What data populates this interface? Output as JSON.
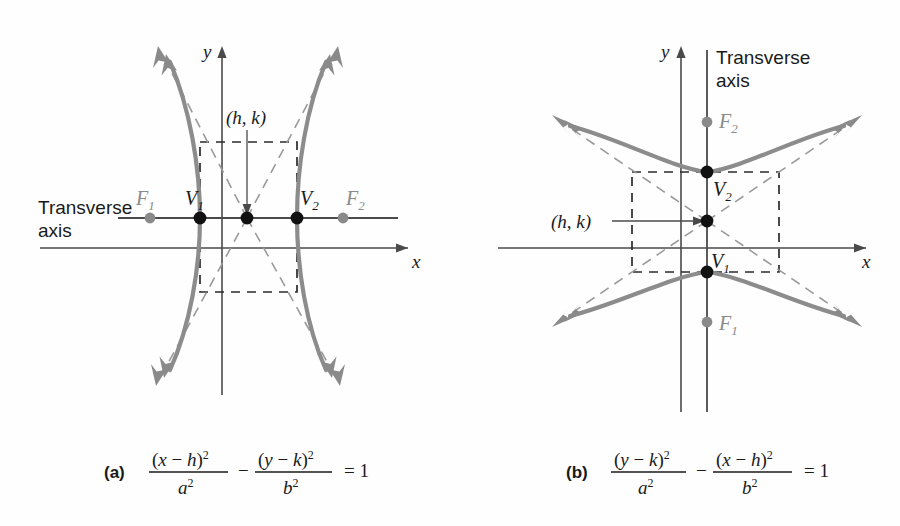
{
  "figure": {
    "title_alt": "Hyperbolas with center at (h, k)",
    "colors": {
      "curve": "#8c8c8c",
      "asymptote": "#9a9a9a",
      "axis": "#4a4a4a",
      "vertex_dot": "#111111",
      "focus_dot": "#8a8a8a",
      "box_dash": "#2b2b2b",
      "text": "#1a1a1a"
    }
  },
  "panel_a": {
    "letter": "(a)",
    "transverse_label_line1": "Transverse",
    "transverse_label_line2": "axis",
    "center_label": "(h, k)",
    "x_axis_label": "x",
    "y_axis_label": "y",
    "points": [
      {
        "name": "F1",
        "base": "F",
        "sub": "1",
        "kind": "focus"
      },
      {
        "name": "V1",
        "base": "V",
        "sub": "1",
        "kind": "vertex"
      },
      {
        "name": "center",
        "base": "",
        "sub": "",
        "kind": "center"
      },
      {
        "name": "V2",
        "base": "V",
        "sub": "2",
        "kind": "vertex"
      },
      {
        "name": "F2",
        "base": "F",
        "sub": "2",
        "kind": "focus"
      }
    ],
    "equation": {
      "num1_open": "(",
      "num1_var": "x",
      "num1_minus": " − ",
      "num1_shift": "h",
      "num1_close": ")",
      "num1_exp": "2",
      "den1_var": "a",
      "den1_exp": "2",
      "operator": "−",
      "num2_open": "(",
      "num2_var": "y",
      "num2_minus": " − ",
      "num2_shift": "k",
      "num2_close": ")",
      "num2_exp": "2",
      "den2_var": "b",
      "den2_exp": "2",
      "equals": "= 1"
    },
    "equation_plain": "(x − h)^2 / a^2 − (y − k)^2 / b^2 = 1"
  },
  "panel_b": {
    "letter": "(b)",
    "transverse_label_line1": "Transverse",
    "transverse_label_line2": "axis",
    "center_label": "(h, k)",
    "x_axis_label": "x",
    "y_axis_label": "y",
    "points": [
      {
        "name": "F2",
        "base": "F",
        "sub": "2",
        "kind": "focus"
      },
      {
        "name": "V2",
        "base": "V",
        "sub": "2",
        "kind": "vertex"
      },
      {
        "name": "center",
        "base": "",
        "sub": "",
        "kind": "center"
      },
      {
        "name": "V1",
        "base": "V",
        "sub": "1",
        "kind": "vertex"
      },
      {
        "name": "F1",
        "base": "F",
        "sub": "1",
        "kind": "focus"
      }
    ],
    "equation": {
      "num1_open": "(",
      "num1_var": "y",
      "num1_minus": " − ",
      "num1_shift": "k",
      "num1_close": ")",
      "num1_exp": "2",
      "den1_var": "a",
      "den1_exp": "2",
      "operator": "−",
      "num2_open": "(",
      "num2_var": "x",
      "num2_minus": " − ",
      "num2_shift": "h",
      "num2_close": ")",
      "num2_exp": "2",
      "den2_var": "b",
      "den2_exp": "2",
      "equals": "= 1"
    },
    "equation_plain": "(y − k)^2 / a^2 − (x − h)^2 / b^2 = 1"
  }
}
